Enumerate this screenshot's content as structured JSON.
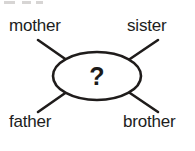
{
  "diagram": {
    "type": "word-web",
    "center": {
      "label": "?",
      "shape": "ellipse"
    },
    "nodes": [
      {
        "id": "mother",
        "label": "mother",
        "position": "top-left"
      },
      {
        "id": "sister",
        "label": "sister",
        "position": "top-right"
      },
      {
        "id": "father",
        "label": "father",
        "position": "bottom-left"
      },
      {
        "id": "brother",
        "label": "brother",
        "position": "bottom-right"
      }
    ],
    "edges": [
      {
        "from": "center",
        "to": "mother"
      },
      {
        "from": "center",
        "to": "sister"
      },
      {
        "from": "center",
        "to": "father"
      },
      {
        "from": "center",
        "to": "brother"
      }
    ],
    "colors": {
      "ink": "#1f1c1b",
      "text": "#201d1c",
      "background": "#ffffff",
      "artifact": "#c9c7c6"
    }
  }
}
